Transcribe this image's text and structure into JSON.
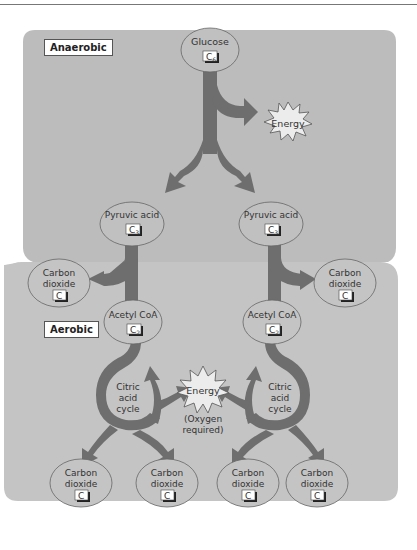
{
  "sections": {
    "anaerobic": {
      "label": "Anaerobic",
      "color": "#bdbdbd"
    },
    "aerobic": {
      "label": "Aerobic",
      "color": "#c6c6c6"
    }
  },
  "nodes": {
    "glucose": {
      "name": "Glucose",
      "carbon": "C",
      "subscript": "6"
    },
    "pyruvic_left": {
      "name": "Pyruvic acid",
      "carbon": "C",
      "subscript": "3"
    },
    "pyruvic_right": {
      "name": "Pyruvic acid",
      "carbon": "C",
      "subscript": "3"
    },
    "co2_left": {
      "line1": "Carbon",
      "line2": "dioxide",
      "carbon": "C"
    },
    "co2_right": {
      "line1": "Carbon",
      "line2": "dioxide",
      "carbon": "C"
    },
    "acetyl_left": {
      "name": "Acetyl CoA",
      "carbon": "C",
      "subscript": "2"
    },
    "acetyl_right": {
      "name": "Acetyl CoA",
      "carbon": "C",
      "subscript": "2"
    },
    "co2_bottom_1": {
      "line1": "Carbon",
      "line2": "dioxide",
      "carbon": "C"
    },
    "co2_bottom_2": {
      "line1": "Carbon",
      "line2": "dioxide",
      "carbon": "C"
    },
    "co2_bottom_3": {
      "line1": "Carbon",
      "line2": "dioxide",
      "carbon": "C"
    },
    "co2_bottom_4": {
      "line1": "Carbon",
      "line2": "dioxide",
      "carbon": "C"
    }
  },
  "cycles": {
    "left": {
      "line1": "Citric",
      "line2": "acid",
      "line3": "cycle"
    },
    "right": {
      "line1": "Citric",
      "line2": "acid",
      "line3": "cycle"
    }
  },
  "energy": {
    "anaerobic": {
      "label": "Energy"
    },
    "aerobic": {
      "label": "Energy",
      "note1": "(Oxygen",
      "note2": "required)"
    }
  },
  "colors": {
    "arrow": "#6e6e6e",
    "ellipse_stroke": "#666666",
    "text": "#333333"
  }
}
